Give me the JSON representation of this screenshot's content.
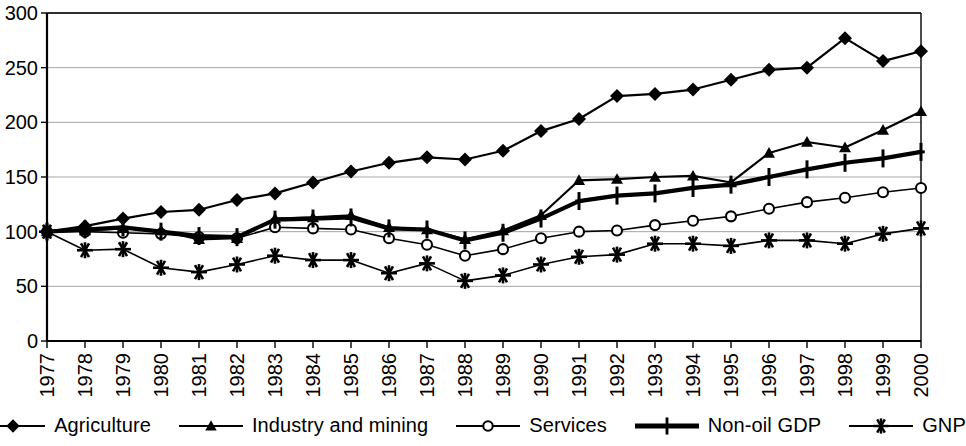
{
  "chart_data": {
    "type": "line",
    "title": "",
    "subtitle": "",
    "xlabel": "",
    "ylabel": "",
    "xlim": [
      1977,
      2000
    ],
    "ylim": [
      0,
      300
    ],
    "ytick_step": 50,
    "ytick_labels": [
      "0",
      "50",
      "100",
      "150",
      "200",
      "250",
      "300"
    ],
    "grid": true,
    "grid_axis": "y",
    "legend_position": "bottom",
    "index_base_year": 1977,
    "index_base_value": 100,
    "categories": [
      "1977",
      "1978",
      "1979",
      "1980",
      "1981",
      "1982",
      "1983",
      "1984",
      "1985",
      "1986",
      "1987",
      "1988",
      "1989",
      "1990",
      "1991",
      "1992",
      "1993",
      "1994",
      "1995",
      "1996",
      "1997",
      "1998",
      "1999",
      "2000"
    ],
    "x": [
      1977,
      1978,
      1979,
      1980,
      1981,
      1982,
      1983,
      1984,
      1985,
      1986,
      1987,
      1988,
      1989,
      1990,
      1991,
      1992,
      1993,
      1994,
      1995,
      1996,
      1997,
      1998,
      1999,
      2000
    ],
    "series": [
      {
        "name": "Agriculture",
        "marker": "diamond",
        "color": "#000000",
        "line_width": 2.2,
        "values": [
          100,
          105,
          112,
          118,
          120,
          129,
          135,
          145,
          155,
          163,
          168,
          166,
          174,
          192,
          203,
          224,
          226,
          230,
          239,
          248,
          250,
          277,
          256,
          265
        ]
      },
      {
        "name": "Industry and mining",
        "marker": "triangle",
        "color": "#000000",
        "line_width": 2.2,
        "values": [
          100,
          101,
          103,
          101,
          93,
          94,
          112,
          113,
          115,
          104,
          102,
          93,
          101,
          115,
          147,
          148,
          150,
          151,
          145,
          172,
          182,
          177,
          193,
          210
        ]
      },
      {
        "name": "Services",
        "marker": "circle-open",
        "color": "#000000",
        "line_width": 1.6,
        "values": [
          100,
          100,
          99,
          98,
          95,
          94,
          104,
          103,
          102,
          94,
          88,
          78,
          84,
          94,
          100,
          101,
          106,
          110,
          114,
          121,
          127,
          131,
          136,
          140
        ]
      },
      {
        "name": "Non-oil GDP",
        "marker": "plus",
        "color": "#000000",
        "line_width": 4.2,
        "values": [
          100,
          102,
          104,
          100,
          96,
          95,
          111,
          112,
          113,
          103,
          102,
          92,
          99,
          112,
          128,
          133,
          135,
          140,
          143,
          150,
          157,
          163,
          167,
          173
        ]
      },
      {
        "name": "GNP",
        "marker": "asterisk",
        "color": "#000000",
        "line_width": 1.6,
        "values": [
          100,
          83,
          84,
          67,
          63,
          70,
          78,
          74,
          74,
          62,
          71,
          55,
          60,
          70,
          77,
          79,
          89,
          89,
          87,
          92,
          92,
          89,
          98,
          103
        ]
      }
    ]
  },
  "legend": {
    "items": [
      {
        "label": "Agriculture",
        "marker": "diamond"
      },
      {
        "label": "Industry and mining",
        "marker": "triangle"
      },
      {
        "label": "Services",
        "marker": "circle-open"
      },
      {
        "label": "Non-oil GDP",
        "marker": "plus"
      },
      {
        "label": "GNP",
        "marker": "asterisk"
      }
    ]
  }
}
